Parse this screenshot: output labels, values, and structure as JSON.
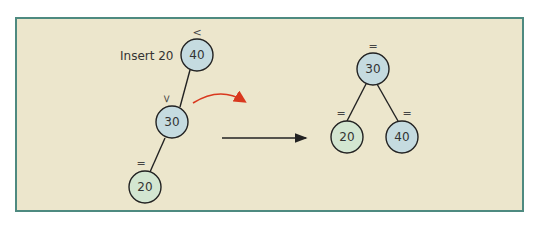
{
  "caption": "Insert 20",
  "colors": {
    "panel_bg": "#ece6cc",
    "panel_border": "#4e8a80",
    "node_blue": "#c5dbe0",
    "node_green": "#d3e6d1",
    "curve_arrow": "#d9381e",
    "line": "#222222"
  },
  "before_tree": {
    "nodes": [
      {
        "value": "40",
        "balance": "<",
        "color": "blue"
      },
      {
        "value": "30",
        "balance": "<",
        "color": "blue"
      },
      {
        "value": "20",
        "balance": "=",
        "color": "green"
      }
    ]
  },
  "after_tree": {
    "nodes": [
      {
        "value": "30",
        "balance": "=",
        "color": "blue"
      },
      {
        "value": "20",
        "balance": "=",
        "color": "green"
      },
      {
        "value": "40",
        "balance": "=",
        "color": "blue"
      }
    ]
  }
}
